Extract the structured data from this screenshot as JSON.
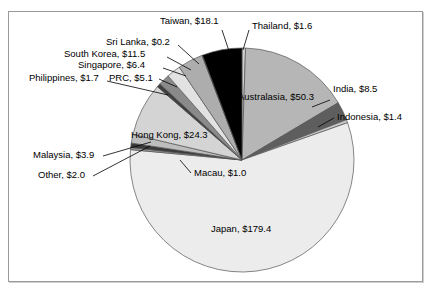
{
  "chart_data": {
    "type": "pie",
    "title": "",
    "subtitle": "",
    "xlabel": "",
    "ylabel": "",
    "legend_position": "none",
    "grid": false,
    "value_prefix": "$",
    "label_format": "{name}, ${value}",
    "total": 315.4,
    "categories": [
      "Thailand",
      "Australasia",
      "India",
      "Indonesia",
      "Japan",
      "Macau",
      "Other",
      "Malaysia",
      "Hong Kong",
      "Philippines",
      "PRC",
      "Singapore",
      "South Korea",
      "Sri Lanka",
      "Taiwan"
    ],
    "values": [
      1.6,
      50.3,
      8.5,
      1.4,
      179.4,
      1.0,
      2.0,
      3.9,
      24.3,
      1.7,
      5.1,
      6.4,
      11.5,
      0.2,
      18.1
    ],
    "slices": [
      {
        "name": "Thailand",
        "value": 1.6,
        "label": "Thailand, $1.6",
        "color": "#d0d0d0"
      },
      {
        "name": "Australasia",
        "value": 50.3,
        "label": "Australasia, $50.3",
        "color": "#b6b6b6"
      },
      {
        "name": "India",
        "value": 8.5,
        "label": "India, $8.5",
        "color": "#5e5e5e"
      },
      {
        "name": "Indonesia",
        "value": 1.4,
        "label": "Indonesia, $1.4",
        "color": "#c8c8c8"
      },
      {
        "name": "Japan",
        "value": 179.4,
        "label": "Japan, $179.4",
        "color": "#ececec"
      },
      {
        "name": "Macau",
        "value": 1.0,
        "label": "Macau, $1.0",
        "color": "#9a9a9a"
      },
      {
        "name": "Other",
        "value": 2.0,
        "label": "Other, $2.0",
        "color": "#3a3a3a"
      },
      {
        "name": "Malaysia",
        "value": 3.9,
        "label": "Malaysia, $3.9",
        "color": "#bdbdbd"
      },
      {
        "name": "Hong Kong",
        "value": 24.3,
        "label": "Hong Kong, $24.3",
        "color": "#d4d4d4"
      },
      {
        "name": "Philippines",
        "value": 1.7,
        "label": "Philippines, $1.7",
        "color": "#3f3f3f"
      },
      {
        "name": "PRC",
        "value": 5.1,
        "label": "PRC, $5.1",
        "color": "#8a8a8a"
      },
      {
        "name": "Singapore",
        "value": 6.4,
        "label": "Singapore, $6.4",
        "color": "#e2e2e2"
      },
      {
        "name": "South Korea",
        "value": 11.5,
        "label": "South Korea, $11.5",
        "color": "#adadad"
      },
      {
        "name": "Sri Lanka",
        "value": 0.2,
        "label": "Sri Lanka, $0.2",
        "color": "#7a7a7a"
      },
      {
        "name": "Taiwan",
        "value": 18.1,
        "label": "Taiwan, $18.1",
        "color": "#000000"
      }
    ]
  },
  "labels": {
    "taiwan": "Taiwan, $18.1",
    "thailand": "Thailand, $1.6",
    "sri_lanka": "Sri Lanka, $0.2",
    "south_korea": "South Korea, $11.5",
    "singapore": "Singapore, $6.4",
    "philippines": "Philippines, $1.7",
    "prc": "PRC, $5.1",
    "australasia": "Australasia, $50.3",
    "india": "India, $8.5",
    "indonesia": "Indonesia, $1.4",
    "hong_kong": "Hong Kong, $24.3",
    "malaysia": "Malaysia, $3.9",
    "other": "Other, $2.0",
    "macau": "Macau, $1.0",
    "japan": "Japan, $179.4"
  },
  "style": {
    "frame_color": "#9a9a9a",
    "background": "#ffffff",
    "outline": "#555555",
    "text_color": "#000000"
  }
}
